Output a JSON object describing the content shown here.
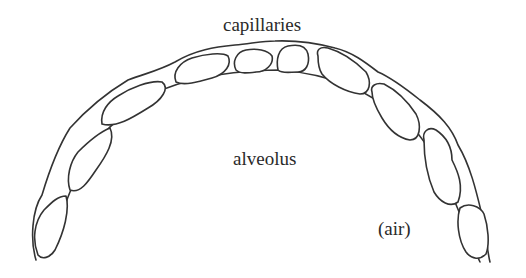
{
  "diagram": {
    "type": "anatomical-sketch",
    "labels": {
      "capillaries": "capillaries",
      "alveolus": "alveolus",
      "air": "(air)"
    },
    "stroke_color": "#333333",
    "background_color": "#ffffff",
    "capillary_count": 10
  }
}
